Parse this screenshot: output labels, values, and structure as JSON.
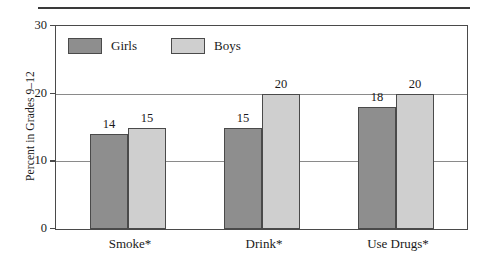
{
  "chart_data": {
    "type": "bar",
    "title": "",
    "xlabel": "",
    "ylabel": "Percent in Grades 9–12",
    "categories": [
      "Smoke*",
      "Drink*",
      "Use Drugs*"
    ],
    "series": [
      {
        "name": "Girls",
        "color": "#8e8e8e",
        "values": [
          14,
          15,
          18
        ]
      },
      {
        "name": "Boys",
        "color": "#cfcfcf",
        "values": [
          15,
          20,
          20
        ]
      }
    ],
    "ylim": [
      0,
      30
    ],
    "yticks": [
      0,
      10,
      20,
      30
    ],
    "ytick_labels": [
      "0",
      "10",
      "20",
      "30"
    ],
    "grid": true,
    "gridlines_at": [
      10,
      20
    ],
    "legend_position": "top-left-inside",
    "data_labels": true
  },
  "axis": {
    "y_title": "Percent in Grades 9–12",
    "tick_0": "0",
    "tick_10": "10",
    "tick_20": "20",
    "tick_30": "30"
  },
  "legend": {
    "girls_label": "Girls",
    "boys_label": "Boys"
  },
  "categories": {
    "cat_0": "Smoke*",
    "cat_1": "Drink*",
    "cat_2": "Use Drugs*"
  },
  "values": {
    "smoke_girls": "14",
    "smoke_boys": "15",
    "drink_girls": "15",
    "drink_boys": "20",
    "drugs_girls": "18",
    "drugs_boys": "20"
  },
  "colors": {
    "girls_fill": "#8e8e8e",
    "boys_fill": "#cfcfcf",
    "frame": "#4a4a4a",
    "gridline": "#8a8a8a",
    "rule": "#3a3a3a"
  }
}
